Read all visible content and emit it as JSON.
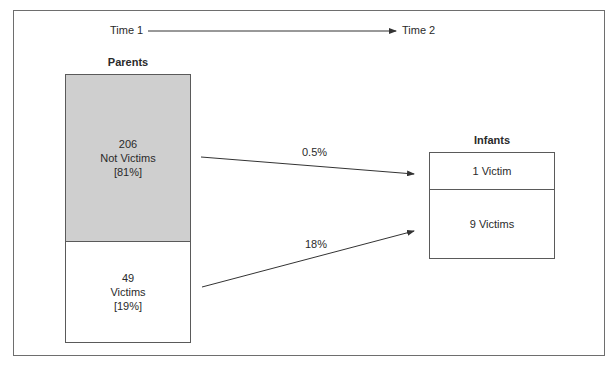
{
  "timeline": {
    "start_label": "Time 1",
    "end_label": "Time 2"
  },
  "parents": {
    "title": "Parents",
    "not_victims": {
      "count": "206",
      "label": "Not Victims",
      "percent": "[81%]",
      "fill": "#cfcfcf"
    },
    "victims": {
      "count": "49",
      "label": "Victims",
      "percent": "[19%]",
      "fill": "#ffffff"
    }
  },
  "infants": {
    "title": "Infants",
    "top": {
      "label": "1 Victim"
    },
    "bottom": {
      "label": "9 Victims"
    }
  },
  "arrows": {
    "upper": {
      "label": "0.5%"
    },
    "lower": {
      "label": "18%"
    }
  }
}
